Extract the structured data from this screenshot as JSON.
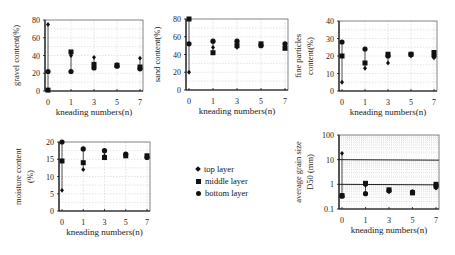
{
  "legend": {
    "items": [
      {
        "label": "top layer",
        "marker": "diamond"
      },
      {
        "label": "middle layer",
        "marker": "square"
      },
      {
        "label": "bottom layer",
        "marker": "circle"
      }
    ]
  },
  "chart_data": [
    {
      "type": "scatter",
      "title": "",
      "xlabel": "kneading numbers(n)",
      "ylabel": "gravel content(%)",
      "x_ticks": [
        0,
        1,
        3,
        5,
        7
      ],
      "y_ticks": [
        0,
        20,
        40,
        60,
        80
      ],
      "ylim": [
        0,
        80
      ],
      "yscale": "linear",
      "grid": true,
      "box": {
        "x": 45,
        "y": 20,
        "w": 98,
        "h": 71
      },
      "series": [
        {
          "name": "top layer",
          "x": [
            0,
            1,
            3,
            5,
            7
          ],
          "y": [
            75,
            40,
            38,
            30,
            37
          ]
        },
        {
          "name": "middle layer",
          "x": [
            0,
            1,
            3,
            5,
            7
          ],
          "y": [
            1,
            44,
            30,
            29,
            27
          ]
        },
        {
          "name": "bottom layer",
          "x": [
            0,
            1,
            3,
            5,
            7
          ],
          "y": [
            22,
            22,
            26,
            28,
            25
          ]
        }
      ]
    },
    {
      "type": "scatter",
      "title": "",
      "xlabel": "kneading numbers(n)",
      "ylabel": "sand content(%)",
      "x_ticks": [
        0,
        1,
        3,
        5,
        7
      ],
      "y_ticks": [
        0,
        20,
        40,
        60,
        80
      ],
      "ylim": [
        0,
        80
      ],
      "yscale": "linear",
      "grid": true,
      "box": {
        "x": 186,
        "y": 19,
        "w": 102,
        "h": 71
      },
      "series": [
        {
          "name": "top layer",
          "x": [
            0,
            1,
            3,
            5,
            7
          ],
          "y": [
            20,
            48,
            48,
            51,
            50
          ]
        },
        {
          "name": "middle layer",
          "x": [
            0,
            1,
            3,
            5,
            7
          ],
          "y": [
            80,
            42,
            50,
            52,
            47
          ]
        },
        {
          "name": "bottom layer",
          "x": [
            0,
            1,
            3,
            5,
            7
          ],
          "y": [
            52,
            55,
            55,
            50,
            52
          ]
        }
      ]
    },
    {
      "type": "scatter",
      "title": "",
      "xlabel": "kneading numbers(n)",
      "ylabel": "fine particles content(%)",
      "x_ticks": [
        0,
        1,
        3,
        5,
        7
      ],
      "y_ticks": [
        0,
        10,
        20,
        30,
        40
      ],
      "ylim": [
        0,
        40
      ],
      "yscale": "linear",
      "grid": true,
      "box": {
        "x": 339,
        "y": 21,
        "w": 98,
        "h": 70
      },
      "series": [
        {
          "name": "top layer",
          "x": [
            0,
            1,
            3,
            5,
            7
          ],
          "y": [
            5,
            13,
            16,
            20,
            19
          ]
        },
        {
          "name": "middle layer",
          "x": [
            0,
            1,
            3,
            5,
            7
          ],
          "y": [
            20,
            16,
            21,
            21,
            22
          ]
        },
        {
          "name": "bottom layer",
          "x": [
            0,
            1,
            3,
            5,
            7
          ],
          "y": [
            28,
            24,
            20,
            21,
            20
          ]
        }
      ]
    },
    {
      "type": "scatter",
      "title": "",
      "xlabel": "kneading numbers(n)",
      "ylabel": "moisture content (%)",
      "x_ticks": [
        0,
        1,
        3,
        5,
        7
      ],
      "y_ticks": [
        0,
        5,
        10,
        15,
        20
      ],
      "ylim": [
        0,
        20
      ],
      "yscale": "linear",
      "grid": true,
      "box": {
        "x": 59,
        "y": 142,
        "w": 91,
        "h": 69
      },
      "series": [
        {
          "name": "top layer",
          "x": [
            0,
            1,
            3,
            5,
            7
          ],
          "y": [
            6,
            12,
            16,
            16,
            16
          ]
        },
        {
          "name": "middle layer",
          "x": [
            0,
            1,
            3,
            5,
            7
          ],
          "y": [
            14.5,
            14,
            15.5,
            16,
            16
          ]
        },
        {
          "name": "bottom layer",
          "x": [
            0,
            1,
            3,
            5,
            7
          ],
          "y": [
            20,
            18,
            17.5,
            16.5,
            15.5
          ]
        }
      ]
    },
    {
      "type": "scatter",
      "title": "",
      "xlabel": "kneading numbers(n)",
      "ylabel": "average grain size D50 (mm)",
      "x_ticks": [
        0,
        1,
        3,
        5,
        7
      ],
      "y_ticks": [
        0.1,
        1,
        10,
        100
      ],
      "ylim": [
        0.1,
        100
      ],
      "yscale": "log",
      "grid": true,
      "reference_lines": [
        10,
        1
      ],
      "box": {
        "x": 339,
        "y": 135,
        "w": 100,
        "h": 74
      },
      "series": [
        {
          "name": "top layer",
          "x": [
            0,
            1,
            3,
            5,
            7
          ],
          "y": [
            18,
            0.9,
            0.5,
            0.5,
            0.7
          ]
        },
        {
          "name": "middle layer",
          "x": [
            0,
            1,
            3,
            5,
            7
          ],
          "y": [
            0.35,
            1.1,
            0.6,
            0.45,
            1.0
          ]
        },
        {
          "name": "bottom layer",
          "x": [
            0,
            1,
            3,
            5,
            7
          ],
          "y": [
            0.33,
            0.42,
            0.55,
            0.48,
            0.8
          ]
        }
      ]
    }
  ]
}
